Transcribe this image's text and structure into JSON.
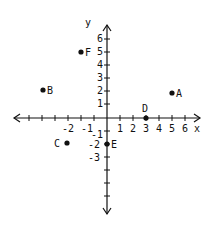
{
  "diagram": {
    "type": "coordinate-plane",
    "axis_labels": {
      "x": "x",
      "y": "y"
    },
    "x_ticks": [
      "-2",
      "-1",
      "1",
      "2",
      "3",
      "4",
      "5",
      "6"
    ],
    "y_ticks": [
      "6",
      "5",
      "4",
      "3",
      "2",
      "1",
      "-1",
      "-2",
      "-3"
    ],
    "points": [
      {
        "label": "A",
        "x": 5,
        "y": 2
      },
      {
        "label": "B",
        "x": -5,
        "y": 2
      },
      {
        "label": "C",
        "x": -3,
        "y": -2
      },
      {
        "label": "D",
        "x": 3,
        "y": 0
      },
      {
        "label": "E",
        "x": 0,
        "y": -2
      },
      {
        "label": "F",
        "x": -2,
        "y": 5
      }
    ],
    "color": "#111111"
  }
}
